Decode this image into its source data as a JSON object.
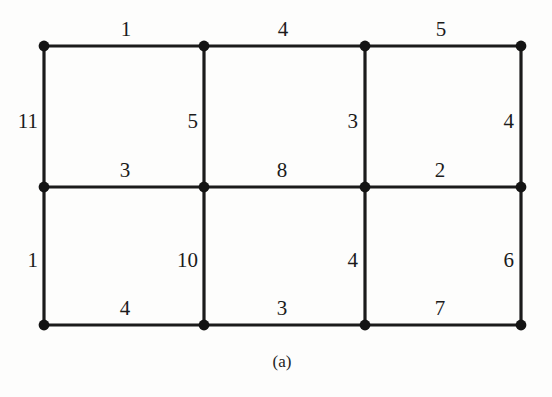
{
  "figure": {
    "caption": "(a)",
    "background_color": "#fdfdfc",
    "ink_color": "#1b1b1b"
  },
  "chart_data": {
    "type": "diagram",
    "title": "",
    "subtitle": "",
    "xlabel": "",
    "ylabel": "",
    "grid": true,
    "legend_position": "none",
    "node_count": 12,
    "edge_count": 17,
    "node_grid": {
      "columns": 4,
      "rows": 3,
      "column_x": [
        44,
        204,
        365,
        521
      ],
      "row_y": [
        46,
        187,
        325
      ]
    },
    "nodes": [
      {
        "id": "v00",
        "row": 0,
        "col": 0,
        "x": 44,
        "y": 46
      },
      {
        "id": "v01",
        "row": 0,
        "col": 1,
        "x": 204,
        "y": 46
      },
      {
        "id": "v02",
        "row": 0,
        "col": 2,
        "x": 365,
        "y": 46
      },
      {
        "id": "v03",
        "row": 0,
        "col": 3,
        "x": 521,
        "y": 46
      },
      {
        "id": "v10",
        "row": 1,
        "col": 0,
        "x": 44,
        "y": 187
      },
      {
        "id": "v11",
        "row": 1,
        "col": 1,
        "x": 204,
        "y": 187
      },
      {
        "id": "v12",
        "row": 1,
        "col": 2,
        "x": 365,
        "y": 187
      },
      {
        "id": "v13",
        "row": 1,
        "col": 3,
        "x": 521,
        "y": 187
      },
      {
        "id": "v20",
        "row": 2,
        "col": 0,
        "x": 44,
        "y": 325
      },
      {
        "id": "v21",
        "row": 2,
        "col": 1,
        "x": 204,
        "y": 325
      },
      {
        "id": "v22",
        "row": 2,
        "col": 2,
        "x": 365,
        "y": 325
      },
      {
        "id": "v23",
        "row": 2,
        "col": 3,
        "x": 521,
        "y": 325
      }
    ],
    "edges": [
      {
        "id": "e-top-1",
        "from": "v00",
        "to": "v01",
        "orientation": "horizontal",
        "weight": 1,
        "label_x": 126,
        "label_y": 40
      },
      {
        "id": "e-top-2",
        "from": "v01",
        "to": "v02",
        "orientation": "horizontal",
        "weight": 4,
        "label_x": 283,
        "label_y": 40
      },
      {
        "id": "e-top-3",
        "from": "v02",
        "to": "v03",
        "orientation": "horizontal",
        "weight": 5,
        "label_x": 441,
        "label_y": 40
      },
      {
        "id": "e-mid-1",
        "from": "v10",
        "to": "v11",
        "orientation": "horizontal",
        "weight": 3,
        "label_x": 125,
        "label_y": 181
      },
      {
        "id": "e-mid-2",
        "from": "v11",
        "to": "v12",
        "orientation": "horizontal",
        "weight": 8,
        "label_x": 282,
        "label_y": 181
      },
      {
        "id": "e-mid-3",
        "from": "v12",
        "to": "v13",
        "orientation": "horizontal",
        "weight": 2,
        "label_x": 440,
        "label_y": 181
      },
      {
        "id": "e-bot-1",
        "from": "v20",
        "to": "v21",
        "orientation": "horizontal",
        "weight": 4,
        "label_x": 125,
        "label_y": 319
      },
      {
        "id": "e-bot-2",
        "from": "v21",
        "to": "v22",
        "orientation": "horizontal",
        "weight": 3,
        "label_x": 282,
        "label_y": 319
      },
      {
        "id": "e-bot-3",
        "from": "v22",
        "to": "v23",
        "orientation": "horizontal",
        "weight": 7,
        "label_x": 440,
        "label_y": 319
      },
      {
        "id": "e-upv-1",
        "from": "v00",
        "to": "v10",
        "orientation": "vertical",
        "weight": 11,
        "label_x": 38,
        "label_y": 121
      },
      {
        "id": "e-upv-2",
        "from": "v01",
        "to": "v11",
        "orientation": "vertical",
        "weight": 5,
        "label_x": 198,
        "label_y": 121
      },
      {
        "id": "e-upv-3",
        "from": "v02",
        "to": "v12",
        "orientation": "vertical",
        "weight": 3,
        "label_x": 358,
        "label_y": 121
      },
      {
        "id": "e-upv-4",
        "from": "v03",
        "to": "v13",
        "orientation": "vertical",
        "weight": 4,
        "label_x": 514,
        "label_y": 121
      },
      {
        "id": "e-lowv-1",
        "from": "v10",
        "to": "v20",
        "orientation": "vertical",
        "weight": 1,
        "label_x": 38,
        "label_y": 260
      },
      {
        "id": "e-lowv-2",
        "from": "v11",
        "to": "v21",
        "orientation": "vertical",
        "weight": 10,
        "label_x": 198,
        "label_y": 260
      },
      {
        "id": "e-lowv-3",
        "from": "v12",
        "to": "v22",
        "orientation": "vertical",
        "weight": 4,
        "label_x": 358,
        "label_y": 260
      },
      {
        "id": "e-lowv-4",
        "from": "v13",
        "to": "v23",
        "orientation": "vertical",
        "weight": 6,
        "label_x": 514,
        "label_y": 260
      }
    ],
    "weights_by_group": {
      "top_horizontal": [
        1,
        4,
        5
      ],
      "middle_horizontal": [
        3,
        8,
        2
      ],
      "bottom_horizontal": [
        4,
        3,
        7
      ],
      "upper_vertical": [
        11,
        5,
        3,
        4
      ],
      "lower_vertical": [
        1,
        10,
        4,
        6
      ]
    }
  }
}
